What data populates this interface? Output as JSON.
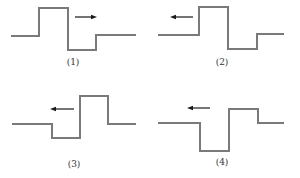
{
  "colors": {
    "waveform": "#7a7a7a",
    "arrow": "#1a1a1a",
    "label": "#333333",
    "background": "#ffffff"
  },
  "panels": [
    {
      "label": "(1)",
      "direction": "right",
      "waveform_points": "11,36 39,36 39,8 68,8 68,50 96,50 96,35 136,35",
      "arrow": {
        "x1": 75,
        "x2": 97,
        "y": 17
      },
      "label_pos": {
        "x": 73,
        "y": 65
      }
    },
    {
      "label": "(2)",
      "direction": "left",
      "waveform_points": "158,35 199,35 199,7 228,7 228,49 257,49 257,34 284,34",
      "arrow": {
        "x1": 193,
        "x2": 170,
        "y": 17
      },
      "label_pos": {
        "x": 222,
        "y": 65
      }
    },
    {
      "label": "(3)",
      "direction": "left",
      "waveform_points": "12,124 52,124 52,138 80,138 80,96 108,96 108,124 136,124",
      "arrow": {
        "x1": 74,
        "x2": 50,
        "y": 109
      },
      "label_pos": {
        "x": 74,
        "y": 167
      }
    },
    {
      "label": "(4)",
      "direction": "left",
      "waveform_points": "158,123 200,123 200,151 229,151 229,109 258,109 258,123 284,123",
      "arrow": {
        "x1": 210,
        "x2": 187,
        "y": 108
      },
      "label_pos": {
        "x": 222,
        "y": 165
      }
    }
  ]
}
